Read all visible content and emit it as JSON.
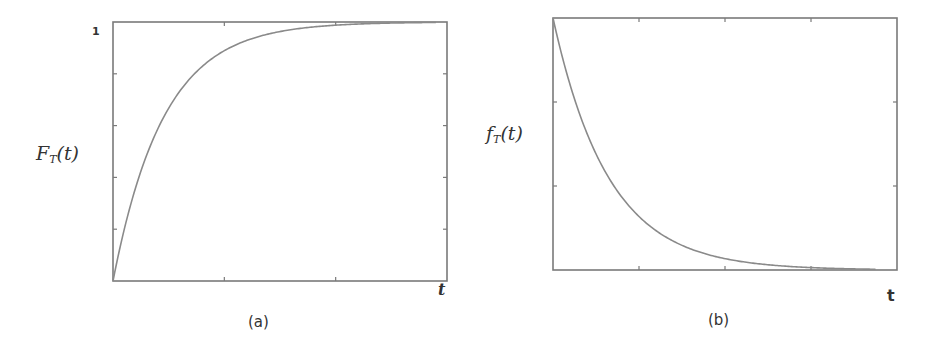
{
  "chart_data": [
    {
      "id": "a",
      "type": "line",
      "title": "",
      "caption": "(a)",
      "xlabel": "t",
      "ylabel_main": "F",
      "ylabel_sub": "T",
      "ylabel_arg": "(t)",
      "ytick_label_top": "1",
      "function": "1 - exp(-lambda t)",
      "lambda": 2.2,
      "xlim": [
        0,
        3
      ],
      "ylim": [
        0,
        1
      ],
      "x_ticks": 3,
      "y_ticks": 5,
      "x": [
        0,
        0.25,
        0.5,
        0.75,
        1.0,
        1.5,
        2.0,
        2.5,
        2.9
      ],
      "values": [
        0,
        0.42,
        0.67,
        0.81,
        0.89,
        0.96,
        0.99,
        1.0,
        1.0
      ],
      "grid": false,
      "frame": {
        "x0": 113,
        "y0": 22,
        "x1": 447,
        "y1": 281
      }
    },
    {
      "id": "b",
      "type": "line",
      "title": "",
      "caption": "(b)",
      "xlabel": "t",
      "ylabel_main": "f",
      "ylabel_sub": "T",
      "ylabel_arg": "(t)",
      "function": "exp(-lambda t)",
      "lambda": 1.55,
      "xlim": [
        0,
        4
      ],
      "ylim": [
        0,
        1
      ],
      "x_ticks": 4,
      "y_ticks": 3,
      "x": [
        0,
        0.25,
        0.5,
        1.0,
        1.5,
        2.0,
        2.5,
        3.0,
        3.75
      ],
      "values": [
        1.0,
        0.68,
        0.46,
        0.21,
        0.1,
        0.045,
        0.02,
        0.01,
        0.003
      ],
      "grid": false,
      "frame": {
        "x0": 553,
        "y0": 18,
        "x1": 897,
        "y1": 270
      }
    }
  ],
  "colors": {
    "axis": "#7a7a7a",
    "curve": "#8a8a8a",
    "text": "#333333",
    "background": "#ffffff"
  }
}
